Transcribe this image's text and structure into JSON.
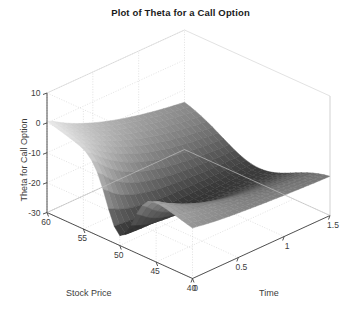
{
  "figure": {
    "background_color": "#ffffff",
    "title": "Plot of Theta for a Call Option"
  },
  "axis_titles": {
    "z": "Theta for Call Option",
    "x": "Stock Price",
    "y": "Time"
  },
  "chart_data": {
    "type": "surface",
    "title": "Plot of Theta for a Call Option",
    "xlabel": "Stock Price",
    "ylabel": "Time",
    "zlabel": "Theta for Call Option",
    "grid": true,
    "legend": "none",
    "colormap": "gray",
    "xlim": [
      40,
      60
    ],
    "ylim": [
      0,
      1.5
    ],
    "zlim": [
      -30,
      10
    ],
    "xticks": [
      60,
      55,
      50,
      45,
      40
    ],
    "yticks": [
      0,
      0.5,
      1,
      1.5
    ],
    "zticks": [
      10,
      0,
      -10,
      -20,
      -30
    ],
    "xtick_labels": [
      "60",
      "55",
      "50",
      "45",
      "40"
    ],
    "ytick_labels": [
      "0",
      "0.5",
      "1",
      "1.5"
    ],
    "ztick_labels": [
      "10",
      "0",
      "-10",
      "-20",
      "-30"
    ],
    "x": [
      40,
      42.5,
      45,
      47.5,
      50,
      52.5,
      55,
      57.5,
      60
    ],
    "y": [
      0.02,
      0.2,
      0.4,
      0.6,
      0.8,
      1.0,
      1.2,
      1.4,
      1.5
    ],
    "z": [
      [
        -0.3,
        -0.4,
        -0.6,
        -2.6,
        -12.1,
        -5.4,
        -1.4,
        -0.4,
        -0.2
      ],
      [
        -1.0,
        -1.7,
        -3.1,
        -5.8,
        -9.2,
        -7.2,
        -4.3,
        -2.3,
        -1.2
      ],
      [
        -1.9,
        -2.9,
        -4.3,
        -6.0,
        -7.3,
        -6.6,
        -5.1,
        -3.5,
        -2.3
      ],
      [
        -2.6,
        -3.5,
        -4.6,
        -5.7,
        -6.3,
        -6.0,
        -5.2,
        -4.1,
        -3.1
      ],
      [
        -3.0,
        -3.8,
        -4.6,
        -5.3,
        -5.7,
        -5.6,
        -5.1,
        -4.3,
        -3.5
      ],
      [
        -3.3,
        -3.9,
        -4.5,
        -5.0,
        -5.3,
        -5.2,
        -4.9,
        -4.4,
        -3.7
      ],
      [
        -3.4,
        -3.9,
        -4.4,
        -4.8,
        -5.0,
        -5.0,
        -4.7,
        -4.3,
        -3.9
      ],
      [
        -3.5,
        -3.9,
        -4.2,
        -4.5,
        -4.7,
        -4.7,
        -4.6,
        -4.3,
        -3.9
      ],
      [
        -3.5,
        -3.8,
        -4.1,
        -4.4,
        -4.5,
        -4.6,
        -4.5,
        -4.2,
        -3.9
      ]
    ],
    "z_display": [
      [
        -25.0,
        -21.8,
        -18.5,
        -15.2,
        -12.0,
        -9.5,
        -7.5,
        -6.2,
        -5.5
      ],
      [
        -24.0,
        -21.0,
        -17.8,
        -15.0,
        -12.5,
        -10.5,
        -9.0,
        -8.0,
        -7.5
      ],
      [
        -22.5,
        -19.8,
        -17.3,
        -15.2,
        -13.6,
        -12.4,
        -11.6,
        -11.0,
        -10.8
      ],
      [
        -20.6,
        -18.5,
        -16.8,
        -15.6,
        -14.8,
        -14.3,
        -14.0,
        -13.9,
        -13.9
      ],
      [
        -18.4,
        -17.2,
        -16.4,
        -16.0,
        -15.8,
        -15.8,
        -15.9,
        -16.1,
        -16.3
      ],
      [
        -16.2,
        -16.0,
        -16.1,
        -16.4,
        -16.8,
        -17.2,
        -17.6,
        -18.0,
        -18.3
      ],
      [
        -14.4,
        -15.2,
        -16.1,
        -17.0,
        -17.9,
        -18.6,
        -19.2,
        -19.7,
        -20.0
      ],
      [
        -13.2,
        -14.8,
        -16.4,
        -17.8,
        -19.0,
        -19.9,
        -20.6,
        -21.0,
        -21.2
      ],
      [
        -12.8,
        -14.7,
        -16.6,
        -18.2,
        -19.5,
        -20.5,
        -21.1,
        -21.5,
        -21.6
      ]
    ],
    "view": {
      "azimuth": -37.5,
      "elevation": 30
    }
  },
  "style": {
    "axis_line_color": "#404040",
    "grid_color": "#cfcfcf",
    "tick_text_color": "#3c3c3c",
    "title_color": "#1a1a1a",
    "surface_dark": "#2b2b2b",
    "surface_light": "#e8e8e8"
  }
}
